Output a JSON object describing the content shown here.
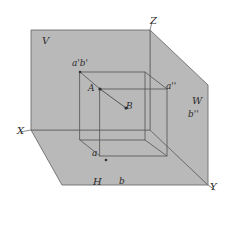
{
  "figure": {
    "background_color": "#ffffff",
    "plane_fill_color": "#b9b9b9",
    "plane_stroke_color": "#6e6e6e",
    "line_color": "#585858",
    "label_color": "#2b2b2b",
    "width": 228,
    "height": 233
  },
  "axes": [
    {
      "name": "x-axis-label",
      "label": "X",
      "x": 17,
      "y": 126
    },
    {
      "name": "y-axis-label",
      "label": "Y",
      "x": 210,
      "y": 182
    },
    {
      "name": "z-axis-label",
      "label": "Z",
      "x": 150,
      "y": 16
    }
  ],
  "planes": [
    {
      "name": "vertical-plane-label",
      "label": "V",
      "x": 42,
      "y": 36
    },
    {
      "name": "horizontal-plane-label",
      "label": "H",
      "x": 93,
      "y": 177
    },
    {
      "name": "profile-plane-label",
      "label": "W",
      "x": 192,
      "y": 96
    }
  ],
  "points": [
    {
      "name": "point-a",
      "label": "A",
      "x": 88,
      "y": 84
    },
    {
      "name": "point-b",
      "label": "B",
      "x": 126,
      "y": 102
    },
    {
      "name": "projection-ab-frontal",
      "label": "a'b'",
      "x": 72,
      "y": 59
    },
    {
      "name": "projection-a-horizontal",
      "label": "a",
      "x": 92,
      "y": 149
    },
    {
      "name": "projection-b-horizontal",
      "label": "b",
      "x": 119,
      "y": 177
    },
    {
      "name": "projection-a-profile",
      "label": "a''",
      "x": 166,
      "y": 82
    },
    {
      "name": "projection-b-profile",
      "label": "b''",
      "x": 188,
      "y": 110
    }
  ],
  "geometry": {
    "vertical_plane_polygon": "31,30 150,30 150,130 31,130",
    "horizontal_plane_polygon": "31,130 150,130 208,185 62,185",
    "profile_plane_polygon": "150,30 208,85 208,185 150,130",
    "box_front_face": "80,72 145,72 145,140 80,140",
    "box_back_face": "100,89 167,89 167,156 100,156",
    "box_connector_1": "80,72 100,89",
    "box_connector_2": "145,72 167,89",
    "box_connector_3": "80,140 100,156",
    "box_connector_4": "145,140 167,156",
    "segment_ab": "100,89 126,108",
    "projector_a_vertical": "80,72 80,140",
    "projector_b_profile": "145,72 145,140",
    "axis_x_line": "20,132 31,130",
    "axis_y_line": "208,185 215,190",
    "axis_z_line": "150,30 152,22"
  }
}
